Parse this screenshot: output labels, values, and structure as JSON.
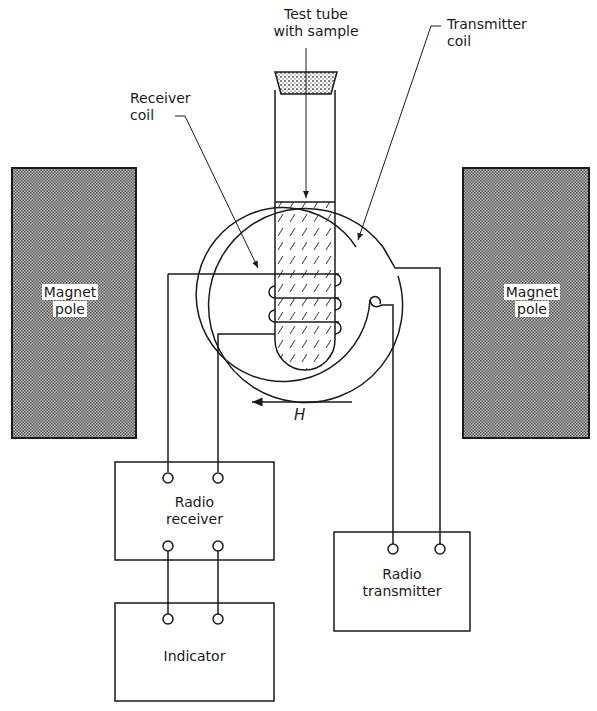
{
  "diagram": {
    "labels": {
      "test_tube_line1": "Test tube",
      "test_tube_line2": "with sample",
      "receiver_coil_line1": "Receiver",
      "receiver_coil_line2": "coil",
      "transmitter_coil_line1": "Transmitter",
      "transmitter_coil_line2": "coil",
      "left_pole_line1": "Magnet",
      "left_pole_line2": "pole",
      "right_pole_line1": "Magnet",
      "right_pole_line2": "pole",
      "field_symbol": "H",
      "receiver_box_line1": "Radio",
      "receiver_box_line2": "receiver",
      "transmitter_box_line1": "Radio",
      "transmitter_box_line2": "transmitter",
      "indicator_box": "Indicator"
    },
    "field_direction": "left",
    "colors": {
      "line": "#1a1a1a",
      "pole_fill": "#8a8a8a",
      "background": "#ffffff"
    }
  }
}
